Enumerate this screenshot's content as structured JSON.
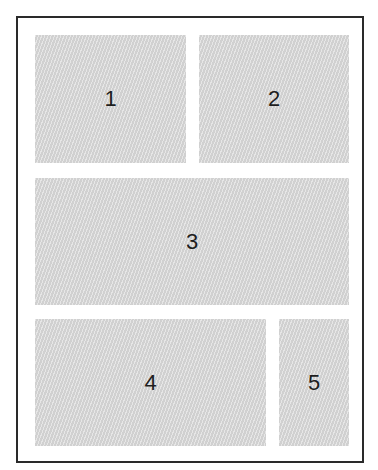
{
  "diagram": {
    "type": "grid-layout",
    "boxes": [
      {
        "label": "1"
      },
      {
        "label": "2"
      },
      {
        "label": "3"
      },
      {
        "label": "4"
      },
      {
        "label": "5"
      }
    ],
    "colors": {
      "frame_border": "#2a2a2a",
      "box_fill": "#d9d9d9",
      "text": "#1e1e1e"
    }
  }
}
